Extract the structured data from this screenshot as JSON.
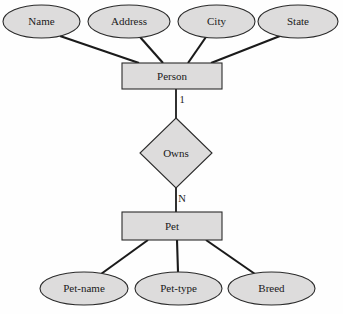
{
  "diagram": {
    "type": "entity-relationship-diagram",
    "title": "",
    "background_color": "#fefefe",
    "shape_fill_color": "#dddcdc",
    "shape_stroke_color": "#2b2b2b",
    "line_color": "#1a1a1a",
    "text_color": "#1a1a1a"
  },
  "entities": [
    {
      "id": "person",
      "label": "Person",
      "shape": "rectangle",
      "x": 122,
      "y": 63,
      "width": 100,
      "height": 26
    },
    {
      "id": "pet",
      "label": "Pet",
      "shape": "rectangle",
      "x": 122,
      "y": 212,
      "width": 100,
      "height": 28
    }
  ],
  "relationships": [
    {
      "id": "owns",
      "label": "Owns",
      "shape": "diamond",
      "cx": 176,
      "cy": 153,
      "rx": 36,
      "ry": 35,
      "from": "person",
      "to": "pet",
      "from_cardinality": "1",
      "to_cardinality": "N"
    }
  ],
  "attributes": [
    {
      "id": "name",
      "label": "Name",
      "shape": "ellipse",
      "owner": "person",
      "cx": 41.5,
      "cy": 21.5,
      "rx": 38.5,
      "ry": 16.5,
      "connect_x": 139
    },
    {
      "id": "address",
      "label": "Address",
      "shape": "ellipse",
      "owner": "person",
      "cx": 129,
      "cy": 21.5,
      "rx": 41,
      "ry": 16.5,
      "connect_x": 163
    },
    {
      "id": "city",
      "label": "City",
      "shape": "ellipse",
      "owner": "person",
      "cx": 216.5,
      "cy": 21.5,
      "rx": 38.5,
      "ry": 16.5,
      "connect_x": 188
    },
    {
      "id": "state",
      "label": "State",
      "shape": "ellipse",
      "owner": "person",
      "cx": 298,
      "cy": 21.5,
      "rx": 40,
      "ry": 16.5,
      "connect_x": 211
    },
    {
      "id": "pet-name",
      "label": "Pet-name",
      "shape": "ellipse",
      "owner": "pet",
      "cx": 84,
      "cy": 288.5,
      "rx": 44,
      "ry": 16.5,
      "connect_x": 148
    },
    {
      "id": "pet-type",
      "label": "Pet-type",
      "shape": "ellipse",
      "owner": "pet",
      "cx": 178.5,
      "cy": 288.5,
      "rx": 43.5,
      "ry": 16.5,
      "connect_x": 177
    },
    {
      "id": "breed",
      "label": "Breed",
      "shape": "ellipse",
      "owner": "pet",
      "cx": 271.5,
      "cy": 288.5,
      "rx": 43.5,
      "ry": 16.5,
      "connect_x": 206
    }
  ],
  "cardinality_labels": [
    {
      "id": "one",
      "text": "1",
      "x": 182,
      "y": 101
    },
    {
      "id": "many",
      "text": "N",
      "x": 182,
      "y": 200
    }
  ]
}
